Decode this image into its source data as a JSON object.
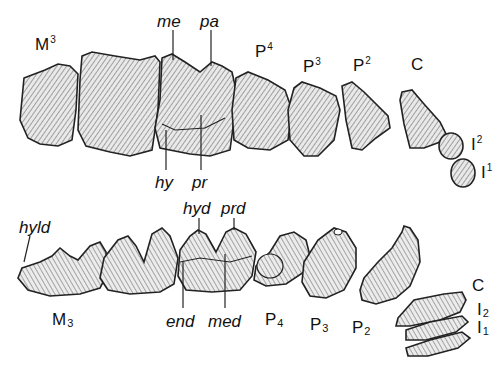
{
  "figure": {
    "type": "dental diagram",
    "upper_row": {
      "teeth": [
        {
          "label": "M",
          "index": "3",
          "position": "sup"
        },
        {
          "label": "P",
          "index": "4",
          "position": "sup"
        },
        {
          "label": "P",
          "index": "3",
          "position": "sup"
        },
        {
          "label": "P",
          "index": "2",
          "position": "sup"
        },
        {
          "label": "C",
          "index": "",
          "position": ""
        },
        {
          "label": "I",
          "index": "2",
          "position": "sup"
        },
        {
          "label": "I",
          "index": "1",
          "position": "sup"
        }
      ],
      "cusps": [
        {
          "label": "me"
        },
        {
          "label": "pa"
        },
        {
          "label": "hy"
        },
        {
          "label": "pr"
        }
      ]
    },
    "lower_row": {
      "teeth": [
        {
          "label": "M",
          "index": "3",
          "position": "sub"
        },
        {
          "label": "P",
          "index": "4",
          "position": "sub"
        },
        {
          "label": "P",
          "index": "3",
          "position": "sub"
        },
        {
          "label": "P",
          "index": "2",
          "position": "sub"
        },
        {
          "label": "C",
          "index": "",
          "position": ""
        },
        {
          "label": "I",
          "index": "2",
          "position": "sub"
        },
        {
          "label": "I",
          "index": "1",
          "position": "sub"
        }
      ],
      "cusps": [
        {
          "label": "hyld"
        },
        {
          "label": "hyd"
        },
        {
          "label": "prd"
        },
        {
          "label": "end"
        },
        {
          "label": "med"
        }
      ]
    }
  }
}
